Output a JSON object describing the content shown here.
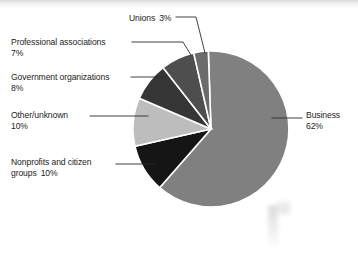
{
  "figure": {
    "background_color": "#ffffff",
    "text_color": "#1d1d1d"
  },
  "chart_data": {
    "type": "pie",
    "title": "",
    "subtitle": "",
    "xlabel": "",
    "ylabel": "",
    "legend_position": "none",
    "grid": false,
    "label_style": "external callouts with leader lines",
    "start_angle_deg": 92,
    "direction": "clockwise",
    "categories": [
      "Business",
      "Nonprofits and citizen groups",
      "Other/unknown",
      "Government organizations",
      "Professional associations",
      "Unions"
    ],
    "values": [
      62,
      10,
      10,
      8,
      7,
      3
    ],
    "units": "percent",
    "slices": [
      {
        "label": "Business",
        "value": 62,
        "value_text": "62%",
        "color": "#808080"
      },
      {
        "label": "Nonprofits and citizen groups",
        "value": 10,
        "value_text": "10%",
        "color": "#151515"
      },
      {
        "label": "Other/unknown",
        "value": 10,
        "value_text": "10%",
        "color": "#bdbdbd"
      },
      {
        "label": "Government organizations",
        "value": 8,
        "value_text": "8%",
        "color": "#363636"
      },
      {
        "label": "Professional associations",
        "value": 7,
        "value_text": "7%",
        "color": "#4e4e4e"
      },
      {
        "label": "Unions",
        "value": 3,
        "value_text": "3%",
        "color": "#6b6b6b"
      }
    ]
  },
  "callouts": {
    "unions": {
      "name": "Unions",
      "percent": "3%"
    },
    "professional_associations": {
      "name": "Professional associations",
      "percent": "7%"
    },
    "government_organizations": {
      "name": "Government organizations",
      "percent": "8%"
    },
    "other_unknown": {
      "name": "Other/unknown",
      "percent": "10%"
    },
    "nonprofits": {
      "name": "Nonprofits and citizen",
      "name_line2": "groups",
      "percent": "10%"
    },
    "business": {
      "name": "Business",
      "percent": "62%"
    }
  }
}
